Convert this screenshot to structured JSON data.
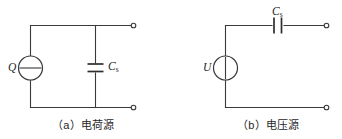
{
  "figure": {
    "type": "circuit-diagram",
    "background_color": "#ffffff",
    "line_color": "#3a3a3a",
    "panel_count": 2
  },
  "panels": [
    {
      "id": "panel-a",
      "caption": "（a）电荷源",
      "caption_label": "(a)",
      "caption_text": "电荷源",
      "source": {
        "symbol_label": "Q",
        "symbol_kind": "current-source-circle-horizontal-bar",
        "orientation": "vertical-branch"
      },
      "capacitor": {
        "label_main": "C",
        "label_sub": "s",
        "orientation": "vertical-branch",
        "plate_style": "horizontal-parallel-plates"
      },
      "terminals": [
        {
          "id": "terminal-a-top",
          "position": "top-right"
        },
        {
          "id": "terminal-a-bottom",
          "position": "bottom-right"
        }
      ]
    },
    {
      "id": "panel-b",
      "caption": "（b）电压源",
      "caption_label": "(b)",
      "caption_text": "电压源",
      "source": {
        "symbol_label": "U",
        "symbol_kind": "voltage-source-circle-vertical-bar",
        "orientation": "vertical-branch"
      },
      "capacitor": {
        "label_main": "C",
        "label_sub": "s",
        "orientation": "horizontal-series",
        "plate_style": "vertical-parallel-plates"
      },
      "terminals": [
        {
          "id": "terminal-b-top",
          "position": "top-right"
        },
        {
          "id": "terminal-b-bottom",
          "position": "bottom-right"
        }
      ]
    }
  ]
}
